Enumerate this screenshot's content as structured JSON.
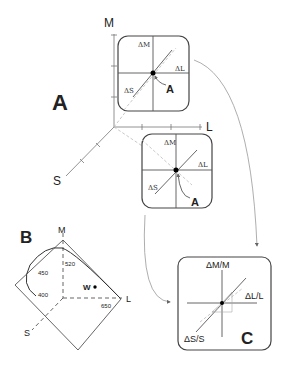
{
  "panels": {
    "A": {
      "label": "A",
      "axes": {
        "m": "M",
        "l": "L",
        "s": "S"
      },
      "inset_top": {
        "dm": "ΔM",
        "dl": "ΔL",
        "ds": "ΔS",
        "point": "A"
      },
      "inset_bottom": {
        "dm": "ΔM",
        "dl": "ΔL",
        "ds": "ΔS",
        "point": "A"
      }
    },
    "B": {
      "label": "B",
      "axes": {
        "m": "M",
        "l": "L",
        "s": "S"
      },
      "wavelengths": [
        "400",
        "450",
        "520",
        "650"
      ],
      "white_point": "W"
    },
    "C": {
      "label": "C",
      "dm": "ΔM/M",
      "dl": "ΔL/L",
      "ds": "ΔS/S"
    }
  },
  "colors": {
    "line": "#333333",
    "light_line": "#888888",
    "dashed": "#aaaaaa"
  }
}
